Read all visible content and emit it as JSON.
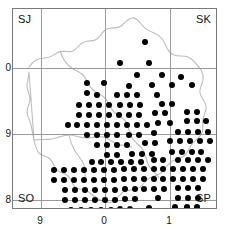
{
  "figure": {
    "type": "distribution-dot-map"
  },
  "quadrant_labels": {
    "top_left": "SJ",
    "top_right": "SK",
    "bottom_left": "SO",
    "bottom_right": "SP"
  },
  "axes": {
    "y_ticks": [
      {
        "label": "0",
        "value": 0
      },
      {
        "label": "9",
        "value": 9
      },
      {
        "label": "8",
        "value": 8
      }
    ],
    "x_ticks": [
      {
        "label": "9",
        "value": 9
      },
      {
        "label": "0",
        "value": 0
      },
      {
        "label": "1",
        "value": 1
      }
    ]
  },
  "colors": {
    "dot": "#000000",
    "grid": "#9a9a9a",
    "frame": "#7a7a7a",
    "coastline": "#bbbbbb",
    "background": "#ffffff"
  },
  "chart_data": {
    "type": "scatter",
    "title": "",
    "xlabel": "",
    "ylabel": "",
    "xlim": [
      -4.0,
      20.8
    ],
    "ylim": [
      -3.0,
      21.3
    ],
    "grid": true,
    "legend": "none",
    "marker": "filled-circle",
    "marker_size_px": 6,
    "grid_lines_x": [
      3.5,
      11.5,
      19.5
    ],
    "grid_lines_y": [
      7.1,
      15.1,
      23.1
    ],
    "point_count": 289,
    "points": [
      [
        12.0,
        1.0
      ],
      [
        9.0,
        3.5
      ],
      [
        12.5,
        3.5
      ],
      [
        11.0,
        5.0
      ],
      [
        14.0,
        5.0
      ],
      [
        5.0,
        6.0
      ],
      [
        5.0,
        7.2
      ],
      [
        7.0,
        6.0
      ],
      [
        10.0,
        6.3
      ],
      [
        12.8,
        6.2
      ],
      [
        15.2,
        6.2
      ],
      [
        16.3,
        5.2
      ],
      [
        17.6,
        6.2
      ],
      [
        6.2,
        7.4
      ],
      [
        8.6,
        7.4
      ],
      [
        9.8,
        7.4
      ],
      [
        11.0,
        7.4
      ],
      [
        13.4,
        7.4
      ],
      [
        4.0,
        8.6
      ],
      [
        5.2,
        8.6
      ],
      [
        6.4,
        8.6
      ],
      [
        7.6,
        8.6
      ],
      [
        9.0,
        8.6
      ],
      [
        10.2,
        8.6
      ],
      [
        11.4,
        8.6
      ],
      [
        14.0,
        8.5
      ],
      [
        15.2,
        8.5
      ],
      [
        4.0,
        9.8
      ],
      [
        5.2,
        9.8
      ],
      [
        6.4,
        9.8
      ],
      [
        7.6,
        9.8
      ],
      [
        8.8,
        9.8
      ],
      [
        10.0,
        9.8
      ],
      [
        11.2,
        9.8
      ],
      [
        13.2,
        9.6
      ],
      [
        14.4,
        9.6
      ],
      [
        17.0,
        9.4
      ],
      [
        18.2,
        9.4
      ],
      [
        2.6,
        11.0
      ],
      [
        3.8,
        11.0
      ],
      [
        5.0,
        11.0
      ],
      [
        6.2,
        11.0
      ],
      [
        7.4,
        11.0
      ],
      [
        8.6,
        11.0
      ],
      [
        9.8,
        11.0
      ],
      [
        11.0,
        11.0
      ],
      [
        12.2,
        11.0
      ],
      [
        13.6,
        10.8
      ],
      [
        15.0,
        10.8
      ],
      [
        17.0,
        10.6
      ],
      [
        18.2,
        10.6
      ],
      [
        19.4,
        10.6
      ],
      [
        5.0,
        12.2
      ],
      [
        6.2,
        12.2
      ],
      [
        7.4,
        12.2
      ],
      [
        8.6,
        12.2
      ],
      [
        10.0,
        12.2
      ],
      [
        11.2,
        12.2
      ],
      [
        13.0,
        12.0
      ],
      [
        16.0,
        11.9
      ],
      [
        17.2,
        11.9
      ],
      [
        18.4,
        11.9
      ],
      [
        19.6,
        11.9
      ],
      [
        6.2,
        13.4
      ],
      [
        7.4,
        13.4
      ],
      [
        8.6,
        13.4
      ],
      [
        9.8,
        13.4
      ],
      [
        12.0,
        13.2
      ],
      [
        13.2,
        13.2
      ],
      [
        15.0,
        13.0
      ],
      [
        16.2,
        13.0
      ],
      [
        17.4,
        13.0
      ],
      [
        18.6,
        13.0
      ],
      [
        19.8,
        13.0
      ],
      [
        7.4,
        14.6
      ],
      [
        8.6,
        14.6
      ],
      [
        10.4,
        14.5
      ],
      [
        11.6,
        14.5
      ],
      [
        12.8,
        14.5
      ],
      [
        15.2,
        14.3
      ],
      [
        16.4,
        14.3
      ],
      [
        17.6,
        14.3
      ],
      [
        18.8,
        14.3
      ],
      [
        5.5,
        15.5
      ],
      [
        6.7,
        15.5
      ],
      [
        7.9,
        15.5
      ],
      [
        9.1,
        15.5
      ],
      [
        10.3,
        15.5
      ],
      [
        11.5,
        15.5
      ],
      [
        13.0,
        15.3
      ],
      [
        14.2,
        15.3
      ],
      [
        16.0,
        15.2
      ],
      [
        17.2,
        15.2
      ],
      [
        18.4,
        15.2
      ],
      [
        19.6,
        15.2
      ],
      [
        1.0,
        16.5
      ],
      [
        2.2,
        16.5
      ],
      [
        3.4,
        16.5
      ],
      [
        4.6,
        16.5
      ],
      [
        5.8,
        16.5
      ],
      [
        7.0,
        16.5
      ],
      [
        8.2,
        16.5
      ],
      [
        9.4,
        16.4
      ],
      [
        10.6,
        16.4
      ],
      [
        11.8,
        16.4
      ],
      [
        13.0,
        16.4
      ],
      [
        14.2,
        16.4
      ],
      [
        15.4,
        16.3
      ],
      [
        16.6,
        16.3
      ],
      [
        17.8,
        16.3
      ],
      [
        19.0,
        16.3
      ],
      [
        1.0,
        17.7
      ],
      [
        2.2,
        17.7
      ],
      [
        3.4,
        17.7
      ],
      [
        4.6,
        17.7
      ],
      [
        5.8,
        17.7
      ],
      [
        7.0,
        17.7
      ],
      [
        8.2,
        17.7
      ],
      [
        9.4,
        17.6
      ],
      [
        10.6,
        17.6
      ],
      [
        11.8,
        17.6
      ],
      [
        13.0,
        17.6
      ],
      [
        14.2,
        17.6
      ],
      [
        15.4,
        17.5
      ],
      [
        16.6,
        17.5
      ],
      [
        17.8,
        17.5
      ],
      [
        19.0,
        17.5
      ],
      [
        2.3,
        18.9
      ],
      [
        3.5,
        18.9
      ],
      [
        4.7,
        18.9
      ],
      [
        5.9,
        18.9
      ],
      [
        7.1,
        18.9
      ],
      [
        8.3,
        18.9
      ],
      [
        9.5,
        18.8
      ],
      [
        10.7,
        18.8
      ],
      [
        11.9,
        18.8
      ],
      [
        13.1,
        18.8
      ],
      [
        14.3,
        18.8
      ],
      [
        16.0,
        18.6
      ],
      [
        17.2,
        18.6
      ],
      [
        18.4,
        18.6
      ],
      [
        2.3,
        20.1
      ],
      [
        3.5,
        20.1
      ],
      [
        4.7,
        20.1
      ],
      [
        5.9,
        20.1
      ],
      [
        7.1,
        20.1
      ],
      [
        8.3,
        20.1
      ],
      [
        9.5,
        20.0
      ],
      [
        10.7,
        20.0
      ],
      [
        13.5,
        19.9
      ],
      [
        16.0,
        19.8
      ],
      [
        17.2,
        19.8
      ],
      [
        18.4,
        19.8
      ],
      [
        3.0,
        21.3
      ],
      [
        4.2,
        21.3
      ],
      [
        5.4,
        21.3
      ],
      [
        6.6,
        21.3
      ],
      [
        7.8,
        21.3
      ],
      [
        9.0,
        21.2
      ],
      [
        10.2,
        21.2
      ],
      [
        12.5,
        21.0
      ],
      [
        15.6,
        20.9
      ],
      [
        17.0,
        20.9
      ],
      [
        18.2,
        20.9
      ],
      [
        2.0,
        22.5
      ],
      [
        3.2,
        22.5
      ],
      [
        4.4,
        22.5
      ],
      [
        5.6,
        22.5
      ],
      [
        8.0,
        22.4
      ],
      [
        10.0,
        22.4
      ],
      [
        13.0,
        22.2
      ],
      [
        16.2,
        22.1
      ],
      [
        17.4,
        22.1
      ],
      [
        2.0,
        23.7
      ],
      [
        3.2,
        23.7
      ],
      [
        4.4,
        23.7
      ],
      [
        5.6,
        23.7
      ],
      [
        7.8,
        23.6
      ],
      [
        9.8,
        23.6
      ],
      [
        12.6,
        23.4
      ],
      [
        16.0,
        23.3
      ],
      [
        17.2,
        23.3
      ],
      [
        1.0,
        25.0
      ],
      [
        4.0,
        25.0
      ],
      [
        6.6,
        24.9
      ],
      [
        10.4,
        24.7
      ],
      [
        12.4,
        24.6
      ],
      [
        16.8,
        24.5
      ],
      [
        2.0,
        26.2
      ],
      [
        11.0,
        26.0
      ],
      [
        14.0,
        25.8
      ],
      [
        17.0,
        25.6
      ],
      [
        11.5,
        27.5
      ],
      [
        19.0,
        27.3
      ],
      [
        10.0,
        28.8
      ],
      [
        12.0,
        28.7
      ],
      [
        14.5,
        28.6
      ],
      [
        16.0,
        28.5
      ],
      [
        18.5,
        28.4
      ],
      [
        19.8,
        28.4
      ],
      [
        9.0,
        30.0
      ],
      [
        10.2,
        30.0
      ],
      [
        11.4,
        30.0
      ],
      [
        12.6,
        30.0
      ],
      [
        14.0,
        29.8
      ],
      [
        15.2,
        29.8
      ],
      [
        17.5,
        29.6
      ],
      [
        19.0,
        29.6
      ],
      [
        8.0,
        31.2
      ],
      [
        9.5,
        31.2
      ],
      [
        10.7,
        31.2
      ],
      [
        11.9,
        31.2
      ],
      [
        13.1,
        31.2
      ],
      [
        8.6,
        32.4
      ]
    ]
  }
}
